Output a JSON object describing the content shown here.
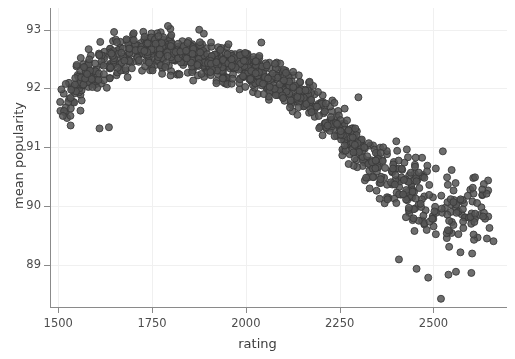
{
  "chart_data": {
    "type": "scatter",
    "title": "",
    "xlabel": "rating",
    "ylabel": "mean popularity",
    "xlim": [
      1478,
      2696
    ],
    "ylim": [
      88.28,
      93.37
    ],
    "xticks": [
      1500,
      1750,
      2000,
      2250,
      2500
    ],
    "xtick_labels": [
      "1500",
      "1750",
      "2000",
      "2250",
      "2500"
    ],
    "yticks": [
      89,
      90,
      91,
      92,
      93
    ],
    "ytick_labels": [
      "89",
      "90",
      "91",
      "92",
      "93"
    ],
    "grid": true,
    "grid_color": "#f0f0f0",
    "legend": null,
    "marker": {
      "shape": "circle",
      "size_px": 7,
      "fill_color": "#555555",
      "edge_color": "#3a3a3a",
      "opacity": 0.85
    },
    "n_points": 1100,
    "trend_points": [
      {
        "x": 1500,
        "y": 91.72
      },
      {
        "x": 1550,
        "y": 92.02
      },
      {
        "x": 1600,
        "y": 92.32
      },
      {
        "x": 1650,
        "y": 92.52
      },
      {
        "x": 1700,
        "y": 92.64
      },
      {
        "x": 1750,
        "y": 92.66
      },
      {
        "x": 1800,
        "y": 92.6
      },
      {
        "x": 1850,
        "y": 92.53
      },
      {
        "x": 1900,
        "y": 92.46
      },
      {
        "x": 1950,
        "y": 92.4
      },
      {
        "x": 2000,
        "y": 92.33
      },
      {
        "x": 2050,
        "y": 92.22
      },
      {
        "x": 2100,
        "y": 92.07
      },
      {
        "x": 2150,
        "y": 91.88
      },
      {
        "x": 2200,
        "y": 91.64
      },
      {
        "x": 2250,
        "y": 91.34
      },
      {
        "x": 2300,
        "y": 91.02
      },
      {
        "x": 2350,
        "y": 90.72
      },
      {
        "x": 2400,
        "y": 90.45
      },
      {
        "x": 2450,
        "y": 90.24
      },
      {
        "x": 2500,
        "y": 90.1
      },
      {
        "x": 2550,
        "y": 90.0
      },
      {
        "x": 2600,
        "y": 89.94
      },
      {
        "x": 2650,
        "y": 89.88
      }
    ],
    "spread_points": [
      {
        "x": 1500,
        "sd": 0.2
      },
      {
        "x": 1700,
        "sd": 0.17
      },
      {
        "x": 1900,
        "sd": 0.16
      },
      {
        "x": 2100,
        "sd": 0.17
      },
      {
        "x": 2250,
        "sd": 0.19
      },
      {
        "x": 2400,
        "sd": 0.26
      },
      {
        "x": 2500,
        "sd": 0.33
      },
      {
        "x": 2650,
        "sd": 0.34
      }
    ],
    "density_points": [
      {
        "x": 1500,
        "w": 0.55
      },
      {
        "x": 1600,
        "w": 1.0
      },
      {
        "x": 1750,
        "w": 1.3
      },
      {
        "x": 1900,
        "w": 1.25
      },
      {
        "x": 2050,
        "w": 1.15
      },
      {
        "x": 2200,
        "w": 1.0
      },
      {
        "x": 2350,
        "w": 0.9
      },
      {
        "x": 2500,
        "w": 0.95
      },
      {
        "x": 2650,
        "w": 0.45
      }
    ],
    "outliers": [
      {
        "x": 2525,
        "y": 90.93
      },
      {
        "x": 2455,
        "y": 88.93
      },
      {
        "x": 2486,
        "y": 88.78
      },
      {
        "x": 2540,
        "y": 88.83
      },
      {
        "x": 2560,
        "y": 88.88
      },
      {
        "x": 2601,
        "y": 88.86
      },
      {
        "x": 2520,
        "y": 88.42
      },
      {
        "x": 2408,
        "y": 89.09
      },
      {
        "x": 2300,
        "y": 91.85
      },
      {
        "x": 1560,
        "y": 92.52
      },
      {
        "x": 1533,
        "y": 91.37
      },
      {
        "x": 1610,
        "y": 91.32
      },
      {
        "x": 1635,
        "y": 91.34
      },
      {
        "x": 2660,
        "y": 89.4
      },
      {
        "x": 2630,
        "y": 90.28
      }
    ]
  }
}
